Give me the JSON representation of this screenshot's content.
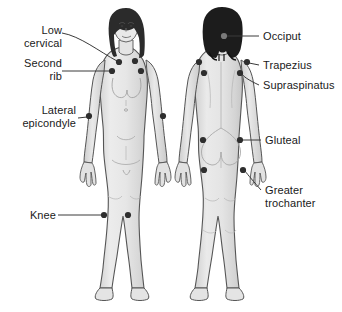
{
  "diagram": {
    "background_color": "#ffffff",
    "body_fill": "#e8e8e8",
    "body_shade": "#d2d2d2",
    "outline_color": "#4a4a4a",
    "hair_front_color": "#2b2b2b",
    "hair_back_color": "#1c1c1c",
    "point_color": "#2e2e2e",
    "leader_color": "#3a3a3a",
    "text_color": "#1a1a1a"
  },
  "figures": [
    {
      "name": "anterior-female-figure",
      "view": "front"
    },
    {
      "name": "posterior-female-figure",
      "view": "back"
    }
  ],
  "labels": {
    "low_cervical": "Low\ncervical",
    "second_rib": "Second\nrib",
    "lateral_epicondyle": "Lateral\nepicondyle",
    "knee": "Knee",
    "occiput": "Occiput",
    "trapezius": "Trapezius",
    "supraspinatus": "Supraspinatus",
    "gluteal": "Gluteal",
    "greater_trochanter": "Greater\ntrochanter"
  },
  "tender_points": [
    {
      "name": "low-cervical-left",
      "x": 119,
      "y": 62,
      "figure": "front"
    },
    {
      "name": "low-cervical-right",
      "x": 135,
      "y": 61,
      "figure": "front"
    },
    {
      "name": "second-rib-left",
      "x": 112,
      "y": 71,
      "figure": "front"
    },
    {
      "name": "second-rib-right",
      "x": 141,
      "y": 71,
      "figure": "front"
    },
    {
      "name": "lateral-epicondyle-left",
      "x": 89,
      "y": 116,
      "figure": "front"
    },
    {
      "name": "lateral-epicondyle-right",
      "x": 163,
      "y": 116,
      "figure": "front"
    },
    {
      "name": "knee-left",
      "x": 104,
      "y": 215,
      "figure": "front"
    },
    {
      "name": "knee-right",
      "x": 128,
      "y": 215,
      "figure": "front"
    },
    {
      "name": "occiput",
      "x": 224,
      "y": 36,
      "figure": "back"
    },
    {
      "name": "trapezius-left",
      "x": 199,
      "y": 62,
      "figure": "back"
    },
    {
      "name": "trapezius-right",
      "x": 247,
      "y": 62,
      "figure": "back"
    },
    {
      "name": "supraspinatus-left",
      "x": 204,
      "y": 73,
      "figure": "back"
    },
    {
      "name": "supraspinatus-right",
      "x": 240,
      "y": 73,
      "figure": "back"
    },
    {
      "name": "gluteal-left",
      "x": 203,
      "y": 140,
      "figure": "back"
    },
    {
      "name": "gluteal-right",
      "x": 240,
      "y": 140,
      "figure": "back"
    },
    {
      "name": "greater-trochanter-left",
      "x": 204,
      "y": 170,
      "figure": "back"
    },
    {
      "name": "greater-trochanter-right",
      "x": 243,
      "y": 170,
      "figure": "back"
    }
  ]
}
